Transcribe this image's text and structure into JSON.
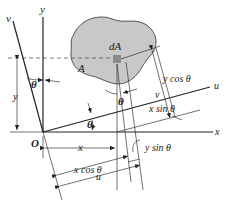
{
  "diagram": {
    "type": "rotated-axes-area-element",
    "labels": {
      "v_axis": "v",
      "y_axis": "y",
      "u_axis": "u",
      "x_axis": "x",
      "origin": "O",
      "area": "A",
      "element": "dA",
      "theta_top_left": "θ",
      "theta_center": "θ",
      "theta_bottom": "θ",
      "y_dim": "y",
      "x_dim": "x",
      "v_dim": "v",
      "u_dim": "u",
      "y_cos": "y cos θ",
      "x_sin": "x sin θ",
      "x_cos": "x cos θ",
      "y_sin": "y sin θ"
    },
    "colors": {
      "shape_fill": "#c8c8c8",
      "element_fill": "#8a8a8a",
      "line": "#222222"
    }
  }
}
